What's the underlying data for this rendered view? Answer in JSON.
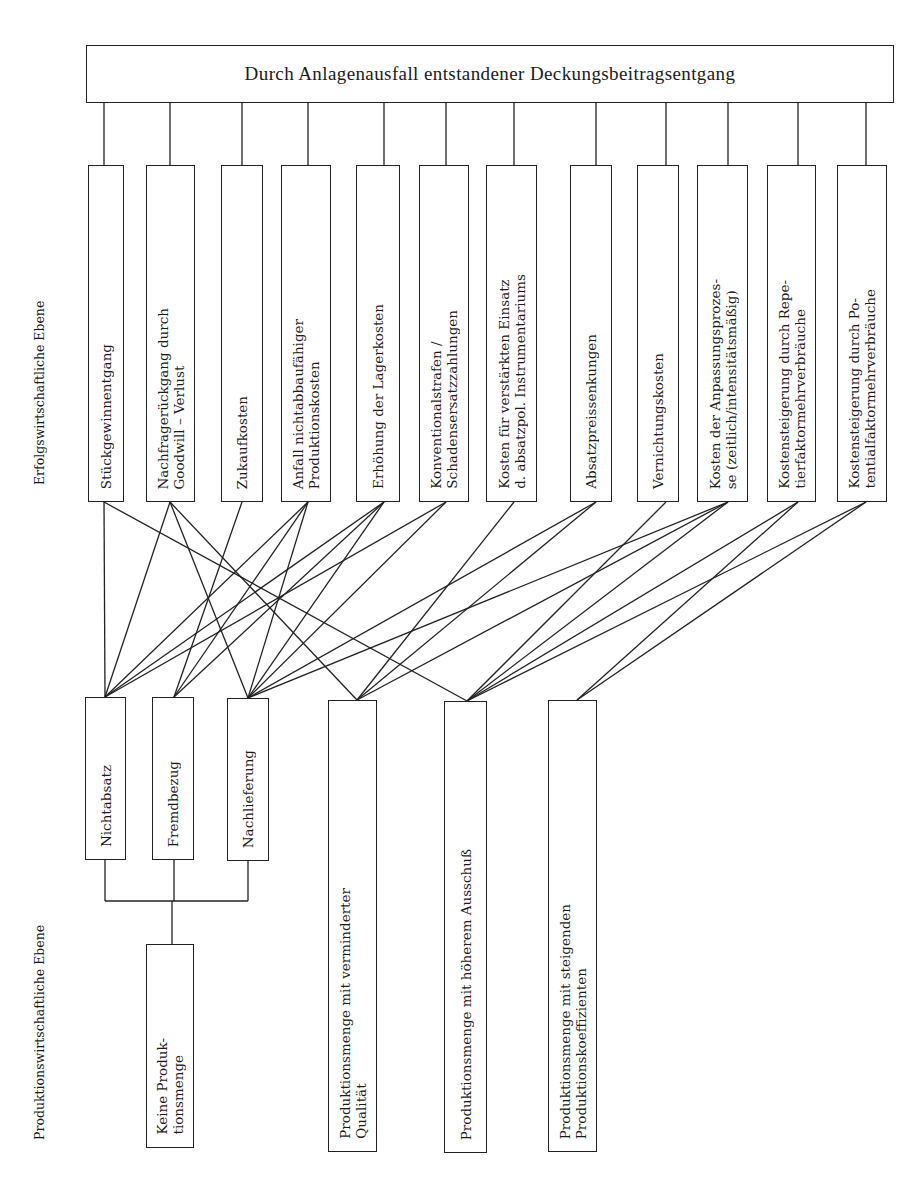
{
  "diagram": {
    "header": {
      "title": "Durch Anlagenausfall entstandener Deckungsbeitragsentgang",
      "box": {
        "x": 86,
        "y": 45,
        "w": 808,
        "h": 58
      }
    },
    "levels": {
      "upper": "Erfolgswirtschaftliche Ebene",
      "lower": "Produktionswirtschaftliche Ebene"
    },
    "top_boxes": [
      {
        "id": "t1",
        "label": "Stückgewinnentgang",
        "x": 88,
        "w": 36,
        "cx": 104
      },
      {
        "id": "t2",
        "label": "Nachfragerückgang durch\nGoodwill – Verlust",
        "x": 146,
        "w": 49,
        "cx": 170
      },
      {
        "id": "t3",
        "label": "Zukaufkosten",
        "x": 221,
        "w": 42,
        "cx": 242
      },
      {
        "id": "t4",
        "label": "Anfall nichtabbaufähiger\nProduktionskosten",
        "x": 281,
        "w": 50,
        "cx": 308
      },
      {
        "id": "t5",
        "label": "Erhöhung der Lagerkosten",
        "x": 356,
        "w": 44,
        "cx": 384
      },
      {
        "id": "t6",
        "label": "Konventionalstrafen /\nSchadensersatzzahlungen",
        "x": 419,
        "w": 50,
        "cx": 446
      },
      {
        "id": "t7",
        "label": "Kosten für verstärkten Einsatz\nd. absatzpol. Instrumentariums",
        "x": 486,
        "w": 51,
        "cx": 514
      },
      {
        "id": "t8",
        "label": "Absatzpreissenkungen",
        "x": 570,
        "w": 42,
        "cx": 596
      },
      {
        "id": "t9",
        "label": "Vernichtungskosten",
        "x": 637,
        "w": 42,
        "cx": 666
      },
      {
        "id": "t10",
        "label": "Kosten der Anpassungsprozes-\nse (zeitlich/intensitätsmäßig)",
        "x": 697,
        "w": 51,
        "cx": 728
      },
      {
        "id": "t11",
        "label": "Kostensteigerung durch Repe-\ntierfaktormehrverbräuche",
        "x": 767,
        "w": 49,
        "cx": 798
      },
      {
        "id": "t12",
        "label": "Kostensteigerung durch Po-\ntentialfaktormehrverbräuche",
        "x": 837,
        "w": 50,
        "cx": 866
      }
    ],
    "top_row": {
      "y": 165,
      "h": 337,
      "connector_top": 103
    },
    "bottom_boxes": [
      {
        "id": "b1",
        "label": "Nichtabsatz",
        "x": 85,
        "y": 697,
        "w": 41,
        "h": 163,
        "cx": 105
      },
      {
        "id": "b2",
        "label": "Fremdbezug",
        "x": 152,
        "y": 697,
        "w": 42,
        "h": 163,
        "cx": 174
      },
      {
        "id": "b3",
        "label": "Nachlieferung",
        "x": 227,
        "y": 698,
        "w": 42,
        "h": 163,
        "cx": 248
      },
      {
        "id": "b4",
        "label": "Produktionsmenge mit verminderter\nQualität",
        "x": 328,
        "y": 700,
        "w": 49,
        "h": 452,
        "cx": 357
      },
      {
        "id": "b5",
        "label": "Produktionsmenge mit höherem Ausschuß",
        "x": 444,
        "y": 701,
        "w": 43,
        "h": 452,
        "cx": 467
      },
      {
        "id": "b6",
        "label": "Produktionsmenge mit steigenden\nProduktionskoeffizienten",
        "x": 548,
        "y": 700,
        "w": 49,
        "h": 452,
        "cx": 577
      },
      {
        "id": "b7",
        "label": "Keine Produk-\ntionsmenge",
        "x": 146,
        "y": 944,
        "w": 48,
        "h": 204,
        "cx": 172
      }
    ],
    "bracket": {
      "y": 901,
      "x1": 105,
      "x2": 248,
      "stem_x": 172,
      "stem_y2": 944
    },
    "connections": [
      [
        "t1",
        "b1"
      ],
      [
        "t1",
        "b5"
      ],
      [
        "t2",
        "b1"
      ],
      [
        "t2",
        "b3"
      ],
      [
        "t2",
        "b4"
      ],
      [
        "t3",
        "b2"
      ],
      [
        "t4",
        "b1"
      ],
      [
        "t4",
        "b2"
      ],
      [
        "t4",
        "b3"
      ],
      [
        "t5",
        "b1"
      ],
      [
        "t5",
        "b2"
      ],
      [
        "t5",
        "b3"
      ],
      [
        "t6",
        "b1"
      ],
      [
        "t6",
        "b3"
      ],
      [
        "t7",
        "b4"
      ],
      [
        "t8",
        "b3"
      ],
      [
        "t8",
        "b4"
      ],
      [
        "t9",
        "b5"
      ],
      [
        "t10",
        "b3"
      ],
      [
        "t10",
        "b4"
      ],
      [
        "t10",
        "b5"
      ],
      [
        "t11",
        "b5"
      ],
      [
        "t11",
        "b6"
      ],
      [
        "t12",
        "b5"
      ],
      [
        "t12",
        "b6"
      ]
    ]
  }
}
